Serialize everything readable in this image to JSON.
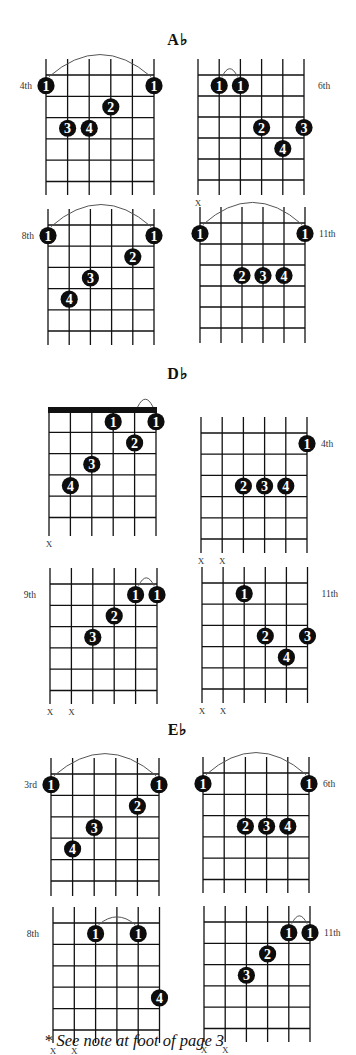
{
  "sections": [
    {
      "title": "A♭",
      "title_y": 40,
      "diagrams": [
        {
          "id": "ab-1",
          "x0": 46,
          "y0": 75,
          "sx": 21.6,
          "fy": 21.3,
          "frets": 5,
          "len": 120,
          "position_label": "4th",
          "label_side": "left",
          "label_fret": 1,
          "barre_arc": [
            1,
            6,
            1
          ],
          "nut": false,
          "muted": [],
          "dots": [
            {
              "s": 1,
              "f": 1,
              "n": "1"
            },
            {
              "s": 6,
              "f": 1,
              "n": "1"
            },
            {
              "s": 4,
              "f": 2,
              "n": "2"
            },
            {
              "s": 2,
              "f": 3,
              "n": "3"
            },
            {
              "s": 3,
              "f": 3,
              "n": "4"
            }
          ]
        },
        {
          "id": "ab-2",
          "x0": 198,
          "y0": 75,
          "sx": 21.2,
          "fy": 21,
          "frets": 5,
          "len": 120,
          "position_label": "6th",
          "label_side": "right",
          "label_fret": 1,
          "barre_arc": [
            2,
            3,
            1
          ],
          "nut": false,
          "muted": [
            1
          ],
          "dots": [
            {
              "s": 2,
              "f": 1,
              "n": "1"
            },
            {
              "s": 3,
              "f": 1,
              "n": "1"
            },
            {
              "s": 4,
              "f": 3,
              "n": "2"
            },
            {
              "s": 6,
              "f": 3,
              "n": "3"
            },
            {
              "s": 5,
              "f": 4,
              "n": "4"
            }
          ]
        },
        {
          "id": "ab-3",
          "x0": 48,
          "y0": 225,
          "sx": 21.2,
          "fy": 21.2,
          "frets": 5,
          "len": 120,
          "position_label": "8th",
          "label_side": "left",
          "label_fret": 1,
          "barre_arc": [
            1,
            6,
            1
          ],
          "nut": false,
          "muted": [],
          "dots": [
            {
              "s": 1,
              "f": 1,
              "n": "1"
            },
            {
              "s": 6,
              "f": 1,
              "n": "1"
            },
            {
              "s": 5,
              "f": 2,
              "n": "2"
            },
            {
              "s": 3,
              "f": 3,
              "n": "3"
            },
            {
              "s": 2,
              "f": 4,
              "n": "4"
            }
          ]
        },
        {
          "id": "ab-4",
          "x0": 200,
          "y0": 223,
          "sx": 21,
          "fy": 21,
          "frets": 5,
          "len": 120,
          "position_label": "11th",
          "label_side": "right",
          "label_fret": 1,
          "barre_arc": [
            1,
            6,
            1
          ],
          "nut": false,
          "muted": [],
          "dots": [
            {
              "s": 1,
              "f": 1,
              "n": "1"
            },
            {
              "s": 6,
              "f": 1,
              "n": "1"
            },
            {
              "s": 3,
              "f": 3,
              "n": "2"
            },
            {
              "s": 4,
              "f": 3,
              "n": "3"
            },
            {
              "s": 5,
              "f": 3,
              "n": "4"
            }
          ]
        }
      ]
    },
    {
      "title": "D♭",
      "title_y": 374,
      "diagrams": [
        {
          "id": "db-1",
          "x0": 49,
          "y0": 411,
          "sx": 21.4,
          "fy": 21.3,
          "frets": 5,
          "len": 125,
          "position_label": "",
          "label_side": "left",
          "label_fret": 1,
          "barre_arc": [
            5,
            6,
            0
          ],
          "nut": true,
          "muted": [
            1
          ],
          "dots": [
            {
              "s": 4,
              "f": 1,
              "n": "1"
            },
            {
              "s": 6,
              "f": 1,
              "n": "1"
            },
            {
              "s": 5,
              "f": 2,
              "n": "2"
            },
            {
              "s": 3,
              "f": 3,
              "n": "3"
            },
            {
              "s": 2,
              "f": 4,
              "n": "4"
            }
          ]
        },
        {
          "id": "db-2",
          "x0": 201,
          "y0": 433,
          "sx": 21.2,
          "fy": 21.2,
          "frets": 5,
          "len": 120,
          "position_label": "4th",
          "label_side": "right",
          "label_fret": 1,
          "barre_arc": null,
          "nut": false,
          "muted": [
            1,
            2
          ],
          "dots": [
            {
              "s": 6,
              "f": 1,
              "n": "1"
            },
            {
              "s": 3,
              "f": 3,
              "n": "2"
            },
            {
              "s": 4,
              "f": 3,
              "n": "3"
            },
            {
              "s": 5,
              "f": 3,
              "n": "4"
            }
          ]
        },
        {
          "id": "db-3",
          "x0": 50,
          "y0": 584,
          "sx": 21.4,
          "fy": 21.3,
          "frets": 5,
          "len": 120,
          "position_label": "9th",
          "label_side": "left",
          "label_fret": 1,
          "barre_arc": [
            5,
            6,
            1
          ],
          "nut": false,
          "muted": [
            1,
            2
          ],
          "dots": [
            {
              "s": 5,
              "f": 1,
              "n": "1"
            },
            {
              "s": 6,
              "f": 1,
              "n": "1"
            },
            {
              "s": 4,
              "f": 2,
              "n": "2"
            },
            {
              "s": 3,
              "f": 3,
              "n": "3"
            }
          ]
        },
        {
          "id": "db-4",
          "x0": 202,
          "y0": 583,
          "sx": 21.1,
          "fy": 21.2,
          "frets": 5,
          "len": 120,
          "position_label": "11th",
          "label_side": "right",
          "label_fret": 1,
          "barre_arc": null,
          "nut": false,
          "muted": [
            1,
            2
          ],
          "dots": [
            {
              "s": 3,
              "f": 1,
              "n": "1"
            },
            {
              "s": 4,
              "f": 3,
              "n": "2"
            },
            {
              "s": 6,
              "f": 3,
              "n": "3"
            },
            {
              "s": 5,
              "f": 4,
              "n": "4"
            }
          ]
        }
      ]
    },
    {
      "title": "E♭",
      "title_y": 730,
      "diagrams": [
        {
          "id": "eb-1",
          "x0": 51,
          "y0": 774,
          "sx": 21.6,
          "fy": 21.4,
          "frets": 5,
          "len": 122,
          "position_label": "3rd",
          "label_side": "left",
          "label_fret": 1,
          "barre_arc": [
            1,
            6,
            1
          ],
          "nut": false,
          "muted": [],
          "dots": [
            {
              "s": 1,
              "f": 1,
              "n": "1"
            },
            {
              "s": 6,
              "f": 1,
              "n": "1"
            },
            {
              "s": 5,
              "f": 2,
              "n": "2"
            },
            {
              "s": 3,
              "f": 3,
              "n": "3"
            },
            {
              "s": 2,
              "f": 4,
              "n": "4"
            }
          ]
        },
        {
          "id": "eb-2",
          "x0": 203,
          "y0": 773,
          "sx": 21.2,
          "fy": 21.3,
          "frets": 5,
          "len": 120,
          "position_label": "6th",
          "label_side": "right",
          "label_fret": 1,
          "barre_arc": [
            1,
            6,
            1
          ],
          "nut": false,
          "muted": [],
          "dots": [
            {
              "s": 1,
              "f": 1,
              "n": "1"
            },
            {
              "s": 6,
              "f": 1,
              "n": "1"
            },
            {
              "s": 3,
              "f": 3,
              "n": "2"
            },
            {
              "s": 4,
              "f": 3,
              "n": "3"
            },
            {
              "s": 5,
              "f": 3,
              "n": "4"
            }
          ]
        },
        {
          "id": "eb-3",
          "x0": 53,
          "y0": 923,
          "sx": 21.3,
          "fy": 21.4,
          "frets": 5,
          "len": 120,
          "position_label": "8th",
          "label_side": "left",
          "label_fret": 1,
          "barre_arc": [
            3,
            5,
            1
          ],
          "nut": false,
          "muted": [
            1,
            2
          ],
          "dots": [
            {
              "s": 3,
              "f": 1,
              "n": "1"
            },
            {
              "s": 5,
              "f": 1,
              "n": "1"
            },
            {
              "s": 6,
              "f": 4,
              "n": "4"
            }
          ]
        },
        {
          "id": "eb-4",
          "x0": 204,
          "y0": 922,
          "sx": 21.2,
          "fy": 21.3,
          "frets": 5,
          "len": 120,
          "position_label": "11th",
          "label_side": "right",
          "label_fret": 1,
          "barre_arc": [
            5,
            6,
            1
          ],
          "nut": false,
          "muted": [
            1,
            2
          ],
          "dots": [
            {
              "s": 5,
              "f": 1,
              "n": "1"
            },
            {
              "s": 6,
              "f": 1,
              "n": "1"
            },
            {
              "s": 4,
              "f": 2,
              "n": "2"
            },
            {
              "s": 3,
              "f": 3,
              "n": "3"
            }
          ]
        }
      ]
    }
  ],
  "muted_symbol": "X",
  "footnote": "* See note at foot of page 3",
  "colors": {
    "ink": "#111111",
    "dot": "#0d0d0d",
    "dot_text": "#ffffff",
    "arc": "#555555",
    "paper": "#ffffff"
  }
}
